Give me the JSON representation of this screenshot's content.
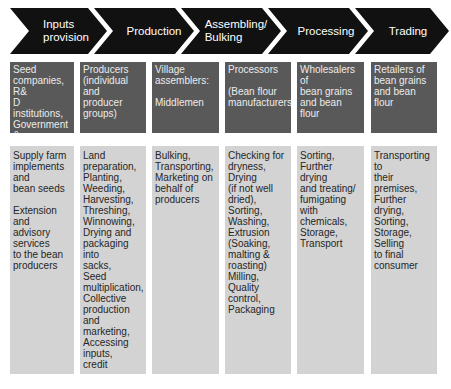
{
  "stages": [
    {
      "label": "Inputs\nprovision"
    },
    {
      "label": "Production"
    },
    {
      "label": "Assembling/\nBulking"
    },
    {
      "label": "Processing"
    },
    {
      "label": "Trading"
    }
  ],
  "actors": [
    {
      "label": "Seed\ncompanies, R&\nD institutions,\nGovernment &\nNGO programs;\nAgro-input\ndealers"
    },
    {
      "label": "Producers\n(individual and\nproducer\ngroups)"
    },
    {
      "label": "Village\nassemblers:\n\nMiddlemen"
    },
    {
      "label": "Processors\n\n(Bean flour\nmanufacturers)"
    },
    {
      "label": "Wholesalers of\nbean grains\nand bean flour"
    },
    {
      "label": "Retailers of\nbean grains\nand bean\nflour"
    }
  ],
  "activities": [
    {
      "label": "Supply farm\nimplements\nand\nbean seeds\n\nExtension and\nadvisory\nservices\nto the bean\nproducers"
    },
    {
      "label": "Land\npreparation,\nPlanting,\nWeeding,\nHarvesting,\nThreshing,\nWinnowing,\nDrying and\npackaging into\nsacks,\nSeed\nmultiplication,\nCollective\nproduction and\nmarketing,\nAccessing\ninputs,\ncredit"
    },
    {
      "label": "Bulking,\nTransporting,\nMarketing on\nbehalf of\nproducers"
    },
    {
      "label": "Checking for\ndryness, Drying\n(if not well\ndried),\nSorting,\nWashing,\nExtrusion\n(Soaking,\nmalting &\nroasting)\nMilling, Quality\ncontrol,\nPackaging"
    },
    {
      "label": "Sorting,\nFurther drying\nand treating/\nfumigating\nwith\nchemicals,\nStorage,\nTransport"
    },
    {
      "label": "Transporting to\ntheir premises,\nFurther drying,\nSorting,\nStorage, Selling\nto final\nconsumer"
    }
  ],
  "colors": {
    "chevron": "#111111",
    "actor_box": "#595959",
    "activity_box": "#d3d3d3"
  }
}
